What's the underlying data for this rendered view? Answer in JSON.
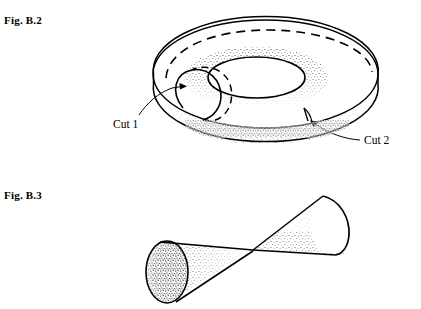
{
  "page": {
    "width": 421,
    "height": 309,
    "background_color": "#ffffff",
    "ink_color": "#000000",
    "kind": "textbook-figure-page"
  },
  "figures": [
    {
      "id": "fig-b2",
      "caption": "Fig. B.2",
      "subject": "torus",
      "description": "A torus (donut) drawn in oblique view with a dashed hidden ridge along the top, a stippled inner funnel and lower band, and two marked cuts.",
      "annotations": [
        {
          "id": "cut-1",
          "label": "Cut 1",
          "description": "meridian cross-section circle through the tube wall"
        },
        {
          "id": "cut-2",
          "label": "Cut 2",
          "description": "longitudinal cut along the outer lower band"
        }
      ]
    },
    {
      "id": "fig-b3",
      "caption": "Fig. B.3",
      "subject": "double-cone",
      "description": "Two cones joined tip to tip at a common apex, the left one small and heavily stippled, the right one larger and lightly stippled.",
      "annotations": []
    }
  ],
  "labels": {
    "fig_b2_caption": "Fig. B.2",
    "fig_b3_caption": "Fig. B.3",
    "cut_1": "Cut 1",
    "cut_2": "Cut 2"
  }
}
